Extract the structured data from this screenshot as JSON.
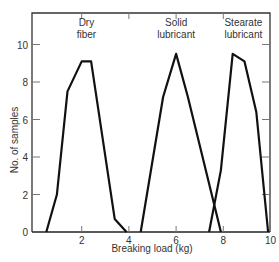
{
  "chart_data": {
    "type": "line",
    "title": "",
    "xlabel": "Breaking load (kg)",
    "ylabel": "No. of samples",
    "xlim": [
      0,
      10
    ],
    "ylim": [
      0,
      11.5
    ],
    "xticks": [
      2,
      4,
      6,
      8,
      10
    ],
    "yticks": [
      0,
      2,
      4,
      6,
      8,
      10
    ],
    "grid": false,
    "legend": "none (series labeled inline above peaks)",
    "series": [
      {
        "name": "Dry fiber",
        "label_lines": [
          "Dry",
          "fiber"
        ],
        "x": [
          0.5,
          0.95,
          1.4,
          2.0,
          2.4,
          3.4,
          3.9
        ],
        "y": [
          0,
          2.0,
          7.5,
          9.1,
          9.1,
          0.7,
          0
        ]
      },
      {
        "name": "Solid lubricant",
        "label_lines": [
          "Solid",
          "lubricant"
        ],
        "x": [
          4.5,
          5.45,
          6.0,
          6.5,
          7.9
        ],
        "y": [
          0,
          7.2,
          9.5,
          7.2,
          0
        ]
      },
      {
        "name": "Stearate lubricant",
        "label_lines": [
          "Stearate",
          "lubricant"
        ],
        "x": [
          7.4,
          7.9,
          8.4,
          8.9,
          9.4,
          9.9
        ],
        "y": [
          0,
          3.3,
          9.5,
          9.1,
          6.4,
          0
        ]
      }
    ]
  }
}
